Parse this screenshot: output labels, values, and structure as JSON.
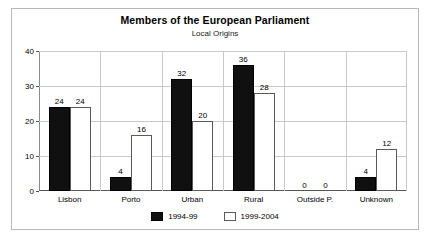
{
  "chart_data": {
    "type": "bar",
    "title": "Members of the European Parliament",
    "subtitle": "Local Origins",
    "xlabel": "",
    "ylabel": "",
    "ylim": [
      0,
      40
    ],
    "yticks": [
      0,
      10,
      20,
      30,
      40
    ],
    "grid": true,
    "legend_position": "bottom",
    "categories": [
      "Lisbon",
      "Porto",
      "Urban",
      "Rural",
      "Outside P.",
      "Unknown"
    ],
    "series": [
      {
        "name": "1994-99",
        "color": "#101010",
        "values": [
          24,
          4,
          32,
          36,
          0,
          4
        ]
      },
      {
        "name": "1999-2004",
        "color": "#ffffff",
        "values": [
          24,
          16,
          20,
          28,
          0,
          12
        ]
      }
    ]
  },
  "frame": {
    "border_color": "#b8b8b8",
    "background": "#ffffff"
  }
}
